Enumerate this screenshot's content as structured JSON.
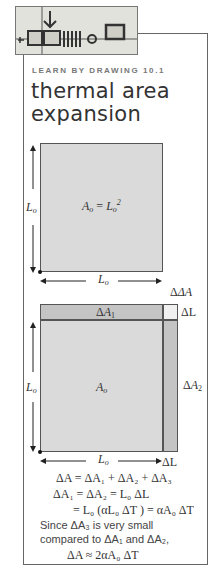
{
  "header": {
    "kicker": "LEARN BY DRAWING 10.1",
    "title_line1": "thermal area",
    "title_line2": "expansion"
  },
  "figure1": {
    "area_label": "A",
    "area_sub": "o",
    "area_eq": " = L",
    "area_sup": "2",
    "side_label": "L",
    "side_sub": "o"
  },
  "figure2": {
    "dA1": "ΔA",
    "dA1_sub": "1",
    "dA2": "ΔA",
    "dA2_sub": "2",
    "dA3": "ΔA",
    "dA3_sub": "3",
    "dL": "ΔL",
    "area_label": "A",
    "area_sub": "o",
    "side_label": "L",
    "side_sub": "o"
  },
  "equations": {
    "line1": "ΔA = ΔA₁ + ΔA₂ + ΔA₃",
    "line2": "ΔA₁ = ΔA₂ = L₀ ΔL",
    "line3": "= L₀ (αL₀ ΔT ) = αA₀ ΔT",
    "line4": "Since ΔA₃ is very small",
    "line5": "compared to ΔA₁ and ΔA₂,",
    "line6": "ΔA ≈ 2αA₀ ΔT"
  }
}
